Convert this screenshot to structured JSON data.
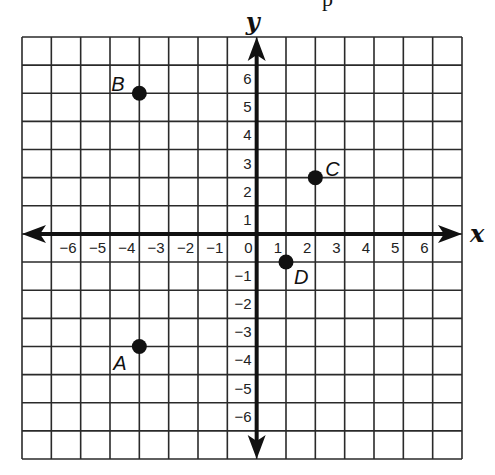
{
  "header_fragment": "p",
  "chart_data": {
    "type": "scatter",
    "title": "",
    "xlabel": "x",
    "ylabel": "y",
    "xlim": [
      -8,
      7
    ],
    "ylim": [
      -8,
      7
    ],
    "grid": true,
    "x_ticks": [
      -6,
      -5,
      -4,
      -3,
      -2,
      -1,
      0,
      1,
      2,
      3,
      4,
      5,
      6
    ],
    "y_ticks": [
      6,
      5,
      4,
      3,
      2,
      1,
      -1,
      -2,
      -3,
      -4,
      -5,
      -6
    ],
    "points": [
      {
        "label": "A",
        "x": -4,
        "y": -4
      },
      {
        "label": "B",
        "x": -4,
        "y": 5
      },
      {
        "label": "C",
        "x": 2,
        "y": 2
      },
      {
        "label": "D",
        "x": 1,
        "y": -1
      }
    ]
  },
  "colors": {
    "ink": "#111111",
    "grid": "#2a2a2a",
    "background": "#ffffff"
  }
}
